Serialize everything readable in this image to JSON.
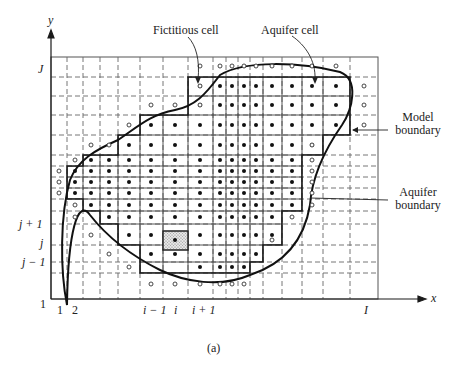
{
  "figure": {
    "caption": "(a)",
    "axes": {
      "x_label": "x",
      "y_label": "y",
      "x_ticks": [
        "1",
        "2",
        "i − 1",
        "i",
        "i + 1",
        "I"
      ],
      "y_ticks": [
        "J",
        "j + 1",
        "j",
        "j − 1",
        "1"
      ]
    },
    "annotations": {
      "fictitious_cell": "Fictitious cell",
      "aquifer_cell": "Aquifer cell",
      "model_boundary_line1": "Model",
      "model_boundary_line2": "boundary",
      "aquifer_boundary_line1": "Aquifer",
      "aquifer_boundary_line2": "boundary"
    },
    "legend_symbols": {
      "aquifer_cell_node": "filled dot",
      "fictitious_cell_node": "open circle",
      "highlighted_cell": "shaded cell (i, j)"
    },
    "colors": {
      "ink": "#1a1a1a",
      "grid": "#555555",
      "shade": "#bdbdbd"
    }
  }
}
